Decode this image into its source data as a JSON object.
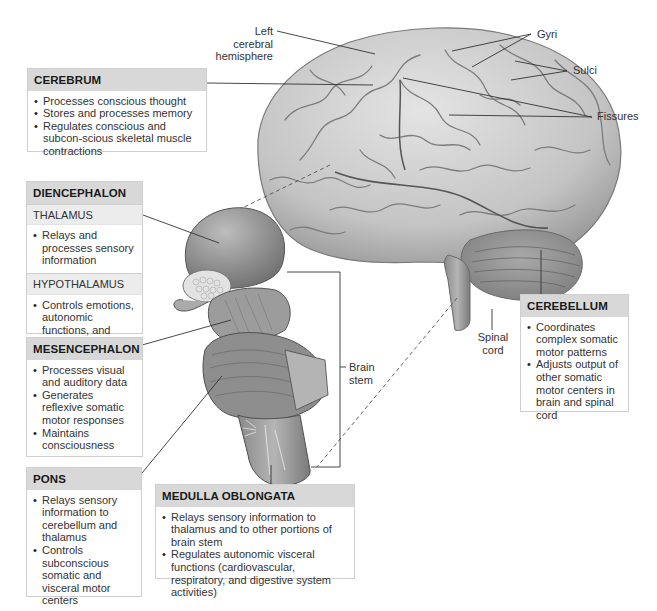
{
  "labels": {
    "left_cerebral_hemisphere": [
      "Left cerebral",
      "hemisphere"
    ],
    "gyri": "Gyri",
    "sulci": "Sulci",
    "fissures": "Fissures",
    "spinal_cord": [
      "Spinal",
      "cord"
    ],
    "brain_stem": [
      "Brain",
      "stem"
    ]
  },
  "boxes": {
    "cerebrum": {
      "title": "CEREBRUM",
      "items": [
        "Processes conscious thought",
        "Stores and processes memory",
        "Regulates conscious and subcon-scious skeletal muscle contractions"
      ]
    },
    "diencephalon": {
      "title": "DIENCEPHALON",
      "thalamus": {
        "title": "THALAMUS",
        "items": [
          "Relays and processes sensory information"
        ]
      },
      "hypothalamus": {
        "title": "HYPOTHALAMUS",
        "items": [
          "Controls emotions, autonomic functions, and hormone production"
        ]
      }
    },
    "mesencephalon": {
      "title": "MESENCEPHALON",
      "items": [
        "Processes visual and auditory data",
        "Generates reflexive somatic motor responses",
        "Maintains consciousness"
      ]
    },
    "pons": {
      "title": "PONS",
      "items": [
        "Relays sensory information to cerebellum and thalamus",
        "Controls subconscious somatic and visceral motor centers"
      ]
    },
    "medulla_oblongata": {
      "title": "MEDULLA OBLONGATA",
      "items": [
        "Relays sensory information to thalamus and to other portions of brain stem",
        "Regulates autonomic visceral functions (cardiovascular, respiratory, and digestive system activities)"
      ]
    },
    "cerebellum": {
      "title": "CEREBELLUM",
      "items": [
        "Coordinates complex somatic motor patterns",
        "Adjusts output of other somatic motor centers in brain and spinal cord"
      ]
    }
  },
  "colors": {
    "header_bg": "#d8d8d8",
    "subheader_bg": "#ececec",
    "brain_fill": "#c9c9c9",
    "brain_shadow": "#8f8f8f",
    "line": "#333333"
  }
}
